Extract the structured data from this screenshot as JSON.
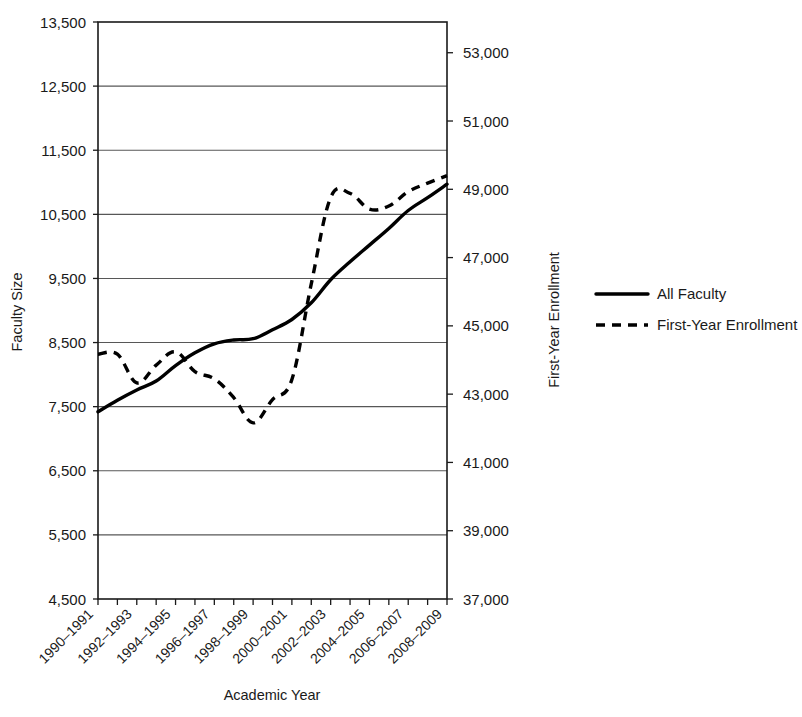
{
  "chart_data": {
    "type": "line",
    "title": "",
    "xlabel": "Academic Year",
    "ylabel": "Faculty Size",
    "y2label": "First-Year Enrollment",
    "grid": true,
    "legend_position": "right",
    "categories": [
      "1990–1991",
      "1991–1992",
      "1992–1993",
      "1993–1994",
      "1994–1995",
      "1995–1996",
      "1996–1997",
      "1997–1998",
      "1998–1999",
      "1999–2000",
      "2000–2001",
      "2001–2002",
      "2002–2003",
      "2003–2004",
      "2004–2005",
      "2005–2006",
      "2006–2007",
      "2007–2008",
      "2008–2009"
    ],
    "visible_tick_labels": [
      "1990–1991",
      "1992–1993",
      "1994–1995",
      "1996–1997",
      "1998–1999",
      "2000–2001",
      "2002–2003",
      "2004–2005",
      "2006–2007",
      "2008–2009"
    ],
    "ylim": [
      4500,
      13500
    ],
    "yticks": [
      4500,
      5500,
      6500,
      7500,
      8500,
      9500,
      10500,
      11500,
      12500,
      13500
    ],
    "ytick_labels": [
      "4,500",
      "5,500",
      "6,500",
      "7,500",
      "8,500",
      "9,500",
      "10,500",
      "11,500",
      "12,500",
      "13,500"
    ],
    "y2lim": [
      37000,
      53900
    ],
    "y2ticks": [
      37000,
      39000,
      41000,
      43000,
      45000,
      47000,
      49000,
      51000,
      53000
    ],
    "y2tick_labels": [
      "37,000",
      "39,000",
      "41,000",
      "43,000",
      "45,000",
      "47,000",
      "49,000",
      "51,000",
      "53,000"
    ],
    "series": [
      {
        "name": "All Faculty",
        "axis": "left",
        "style": "solid",
        "color": "#000000",
        "values": [
          7420,
          7600,
          7760,
          7900,
          8140,
          8340,
          8480,
          8540,
          8560,
          8700,
          8860,
          9120,
          9480,
          9760,
          10020,
          10280,
          10560,
          10760,
          10970
        ]
      },
      {
        "name": "First-Year Enrollment",
        "axis": "right",
        "style": "dashed",
        "color": "#000000",
        "values": [
          44170,
          44170,
          43330,
          43850,
          44240,
          43660,
          43450,
          42900,
          42160,
          42840,
          43430,
          46230,
          48760,
          48880,
          48420,
          48510,
          48930,
          49180,
          49400
        ]
      }
    ],
    "legend": [
      {
        "label": "All Faculty",
        "style": "solid"
      },
      {
        "label": "First-Year Enrollment",
        "style": "dashed"
      }
    ]
  }
}
